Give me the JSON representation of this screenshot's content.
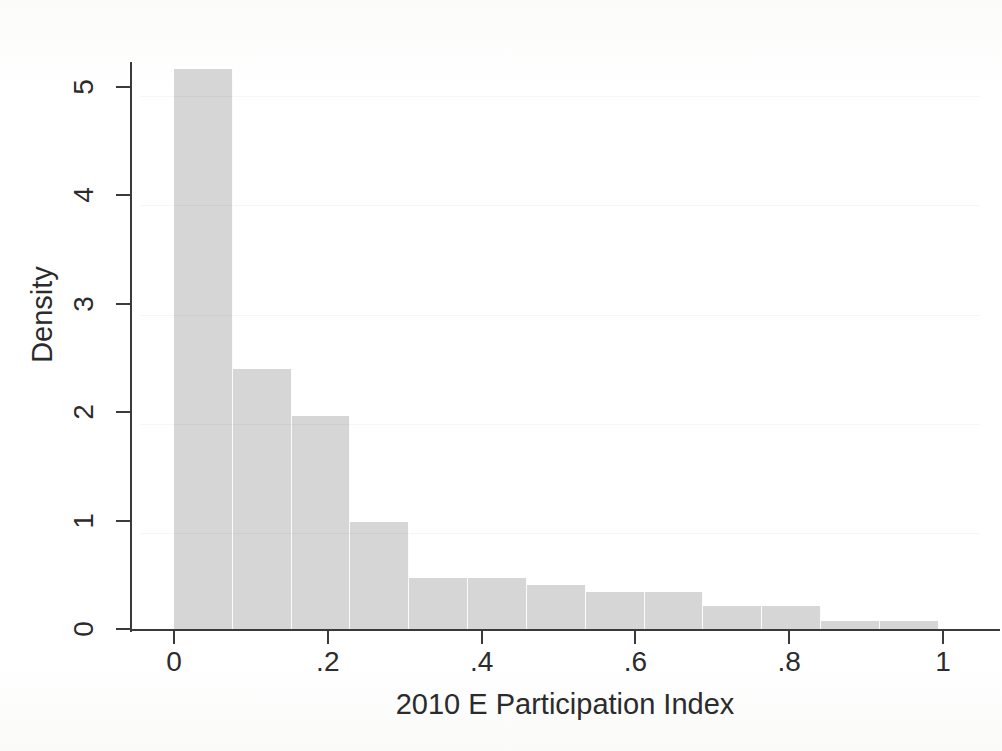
{
  "figure": {
    "background_color": "#ffffff",
    "bar_color": "#d6d6d6",
    "axis_color": "#3a3a3a"
  },
  "chart_data": {
    "type": "bar",
    "title": "",
    "subtitle": "",
    "xlabel": "2010 E Participation Index",
    "ylabel": "Density",
    "xlim": [
      -0.035,
      1.07
    ],
    "ylim": [
      0,
      5.35
    ],
    "xticks": [
      0,
      0.2,
      0.4,
      0.6,
      0.8,
      1
    ],
    "xtick_labels": [
      "0",
      ".2",
      ".4",
      ".6",
      ".8",
      "1"
    ],
    "yticks": [
      0,
      1,
      2,
      3,
      4,
      5
    ],
    "ytick_labels": [
      "0",
      "1",
      "2",
      "3",
      "4",
      "5"
    ],
    "grid": false,
    "legend": null,
    "bin_width": 0.0765,
    "bin_edges": [
      0.0,
      0.0765,
      0.153,
      0.2295,
      0.306,
      0.3825,
      0.459,
      0.5355,
      0.612,
      0.6885,
      0.765,
      0.8415,
      0.918,
      0.9945
    ],
    "bin_centers": [
      0.038,
      0.115,
      0.191,
      0.268,
      0.344,
      0.421,
      0.497,
      0.574,
      0.65,
      0.727,
      0.803,
      0.88,
      0.956
    ],
    "values": [
      5.16,
      2.4,
      1.96,
      0.99,
      0.47,
      0.47,
      0.41,
      0.34,
      0.34,
      0.21,
      0.21,
      0.07,
      0.07
    ],
    "categories": [
      "0.00-0.08",
      "0.08-0.15",
      "0.15-0.23",
      "0.23-0.31",
      "0.31-0.38",
      "0.38-0.46",
      "0.46-0.54",
      "0.54-0.61",
      "0.61-0.69",
      "0.69-0.77",
      "0.77-0.84",
      "0.84-0.92",
      "0.92-0.99"
    ]
  }
}
